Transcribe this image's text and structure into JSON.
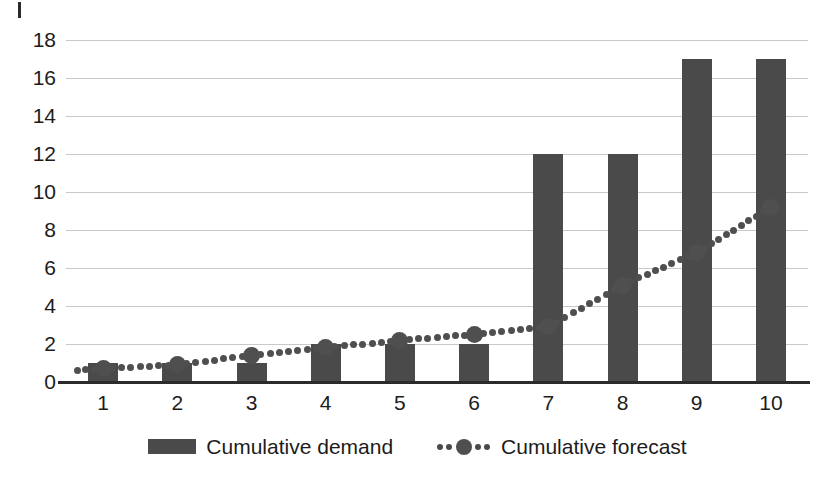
{
  "chart_data": {
    "type": "bar",
    "title": "",
    "subtitle": "",
    "xlabel": "",
    "ylabel": "",
    "categories": [
      "1",
      "2",
      "3",
      "4",
      "5",
      "6",
      "7",
      "8",
      "9",
      "10"
    ],
    "ylim": [
      0,
      18
    ],
    "y_ticks": [
      0,
      2,
      4,
      6,
      8,
      10,
      12,
      14,
      16,
      18
    ],
    "grid": true,
    "legend_position": "bottom",
    "series": [
      {
        "name": "Cumulative demand",
        "type": "bar",
        "color": "#4a4a4a",
        "values": [
          1,
          1,
          1,
          2,
          2,
          2,
          12,
          12,
          17,
          17
        ]
      },
      {
        "name": "Cumulative forecast",
        "type": "line",
        "style": "dotted",
        "marker": "circle",
        "color": "#4f4f4f",
        "values": [
          0.7,
          0.9,
          1.4,
          1.8,
          2.2,
          2.5,
          2.9,
          5.1,
          6.8,
          9.2
        ]
      }
    ]
  },
  "axes": {
    "y_tick_labels": [
      "18",
      "16",
      "14",
      "12",
      "10",
      "8",
      "6",
      "4",
      "2",
      "0"
    ],
    "x_tick_labels": [
      "1",
      "2",
      "3",
      "4",
      "5",
      "6",
      "7",
      "8",
      "9",
      "10"
    ]
  },
  "legend": {
    "items": [
      {
        "label": "Cumulative demand",
        "swatch": "bar-swatch"
      },
      {
        "label": "Cumulative forecast",
        "swatch": "dotted-line-marker-swatch"
      }
    ]
  },
  "colors": {
    "bar": "#4a4a4a",
    "line": "#4f4f4f",
    "grid": "#c9c9c9",
    "axis": "#2b2b2b",
    "text": "#1c1c1c",
    "background": "#ffffff"
  }
}
